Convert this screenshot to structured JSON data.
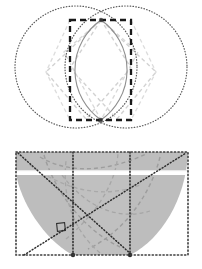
{
  "page": {
    "background": "#ffffff",
    "width": 202,
    "height": 269,
    "figure_count": 2
  },
  "colors": {
    "dotted_outline": "#555555",
    "solid_arc": "#8a8a8a",
    "heavy_dash": "#1a1a1a",
    "faint_dash": "#cfcfcf",
    "mid_dash": "#b4b4b4",
    "fill_gray": "#b9b9b9",
    "fill_gray_light": "#c6c6c6",
    "white_band": "#ffffff",
    "dark_dotted": "#333333"
  },
  "figures": [
    {
      "id": "vesica-figure",
      "name": "two-overlapping-circles-with-dashed-rectangle",
      "caption": "",
      "elements": [
        {
          "name": "left-circle",
          "type": "circle",
          "cx": 76,
          "cy": 67,
          "r": 61,
          "stroke": "dotted"
        },
        {
          "name": "right-circle",
          "type": "circle",
          "cx": 126,
          "cy": 67,
          "r": 61,
          "stroke": "dotted"
        },
        {
          "name": "lens-left-arc",
          "type": "arc",
          "stroke": "solid-gray"
        },
        {
          "name": "lens-right-arc",
          "type": "arc",
          "stroke": "solid-gray"
        },
        {
          "name": "bounding-rectangle",
          "type": "rect",
          "x": 70,
          "y": 20,
          "w": 61,
          "h": 100,
          "stroke": "heavy-dashed"
        },
        {
          "name": "inscribed-diamond-left",
          "type": "polygon",
          "stroke": "faint-dashed"
        },
        {
          "name": "inscribed-diamond-right",
          "type": "polygon",
          "stroke": "faint-dashed"
        },
        {
          "name": "inscribed-diamond-center",
          "type": "polygon",
          "stroke": "faint-dashed"
        },
        {
          "name": "top-intersection-point",
          "type": "point",
          "x": 101,
          "y": 20
        },
        {
          "name": "bottom-intersection-point",
          "type": "point",
          "x": 101,
          "y": 120
        }
      ]
    },
    {
      "id": "arc-fill-figure",
      "name": "dotted-rectangle-with-gray-arc-region",
      "caption": "",
      "elements": [
        {
          "name": "outer-dotted-rectangle",
          "type": "rect",
          "x": 16,
          "y": 17,
          "w": 172,
          "h": 103,
          "stroke": "dotted"
        },
        {
          "name": "gray-filled-region",
          "type": "path",
          "fill": "#b9b9b9"
        },
        {
          "name": "white-horizontal-band",
          "type": "rect",
          "y": 37,
          "h": 4,
          "fill": "#ffffff"
        },
        {
          "name": "diagonal-line-ascending",
          "type": "line",
          "stroke": "dark-dotted"
        },
        {
          "name": "diagonal-line-descending",
          "type": "line",
          "stroke": "dark-dotted"
        },
        {
          "name": "vertical-divider-left",
          "type": "line",
          "x": 73,
          "stroke": "dark-dotted"
        },
        {
          "name": "vertical-divider-right",
          "type": "line",
          "x": 130,
          "stroke": "dark-dotted"
        },
        {
          "name": "right-angle-marker",
          "type": "square",
          "x": 58,
          "y": 89,
          "size": 7
        },
        {
          "name": "construction-curve-a",
          "type": "path",
          "stroke": "mid-dashed"
        },
        {
          "name": "construction-curve-b",
          "type": "path",
          "stroke": "mid-dashed"
        },
        {
          "name": "construction-curve-c",
          "type": "path",
          "stroke": "mid-dashed"
        }
      ]
    }
  ]
}
